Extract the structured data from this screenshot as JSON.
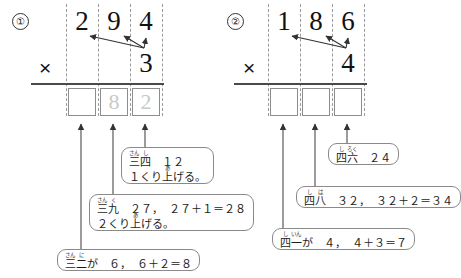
{
  "page": {
    "background": "#ffffff"
  },
  "problems": [
    {
      "marker": "①",
      "multiplicand": [
        "2",
        "9",
        "4"
      ],
      "operator": "×",
      "multiplier": "3",
      "answer_boxes": [
        {
          "value": "",
          "state": "empty"
        },
        {
          "value": "8",
          "state": "faint"
        },
        {
          "value": "2",
          "state": "faint"
        }
      ],
      "callouts": [
        {
          "id": "callout-1-ones",
          "lines": [
            {
              "ruby": [
                {
                  "base": "三",
                  "rt": "さん"
                },
                {
                  "base": "二",
                  "rt": "に"
                }
              ],
              "tail": "が　　６，　６＋２＝８"
            }
          ]
        },
        {
          "id": "callout-1-tens",
          "lines": [
            {
              "ruby": [
                {
                  "base": "三",
                  "rt": "さん"
                },
                {
                  "base": "九",
                  "rt": "く"
                }
              ],
              "tail": "　　２７，　２７＋１＝２８"
            },
            {
              "ruby": [],
              "tail": "２くり上げる。",
              "rt_on": "上",
              "rt_text": "あ"
            }
          ]
        },
        {
          "id": "callout-1-hundreds",
          "lines": [
            {
              "ruby": [
                {
                  "base": "三",
                  "rt": "さん"
                },
                {
                  "base": "四",
                  "rt": "し"
                }
              ],
              "tail": "　　１２"
            },
            {
              "ruby": [],
              "tail": "１くり上げる。",
              "rt_on": "上",
              "rt_text": "あ"
            }
          ]
        }
      ]
    },
    {
      "marker": "②",
      "multiplicand": [
        "1",
        "8",
        "6"
      ],
      "operator": "×",
      "multiplier": "4",
      "answer_boxes": [
        {
          "value": "",
          "state": "empty"
        },
        {
          "value": "",
          "state": "empty"
        },
        {
          "value": "",
          "state": "empty"
        }
      ],
      "callouts": [
        {
          "id": "callout-2-ones",
          "lines": [
            {
              "ruby": [
                {
                  "base": "四",
                  "rt": "し"
                },
                {
                  "base": "一",
                  "rt": "いん"
                }
              ],
              "tail": "が　　４，　４＋３＝７"
            }
          ]
        },
        {
          "id": "callout-2-tens",
          "lines": [
            {
              "ruby": [
                {
                  "base": "四",
                  "rt": "し"
                },
                {
                  "base": "八",
                  "rt": "は"
                }
              ],
              "tail": "　　３２，　３２＋２＝３４"
            }
          ]
        },
        {
          "id": "callout-2-hundreds",
          "lines": [
            {
              "ruby": [
                {
                  "base": "四",
                  "rt": "し"
                },
                {
                  "base": "六",
                  "rt": "ろく"
                }
              ],
              "tail": "　　２４"
            }
          ]
        }
      ]
    }
  ],
  "colors": {
    "ink": "#1a1a1a",
    "rule": "#4a4a4a",
    "box_border": "#8d8d8d",
    "faint_digit": "#c9c9c9",
    "guide": "#9a9a9a",
    "bubble_border": "#8a8a8a"
  }
}
